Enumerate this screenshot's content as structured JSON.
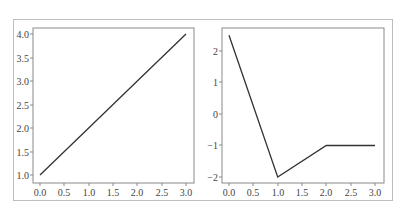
{
  "chart_data": [
    {
      "type": "line",
      "title": "",
      "xlabel": "",
      "ylabel": "",
      "x": [
        0,
        1,
        2,
        3
      ],
      "series": [
        {
          "name": "",
          "values": [
            1,
            2,
            3,
            4
          ],
          "color": "#333333"
        }
      ],
      "xlim": [
        -0.15,
        3.15
      ],
      "ylim": [
        0.85,
        4.15
      ],
      "xticks": [
        "0.0",
        "0.5",
        "1.0",
        "1.5",
        "2.0",
        "2.5",
        "3.0"
      ],
      "yticks": [
        "1.0",
        "1.5",
        "2.0",
        "2.5",
        "3.0",
        "3.5",
        "4.0"
      ],
      "grid": false,
      "legend": null
    },
    {
      "type": "line",
      "title": "",
      "xlabel": "",
      "ylabel": "",
      "x": [
        0,
        1,
        2,
        3
      ],
      "series": [
        {
          "name": "",
          "values": [
            2.5,
            -2,
            -1,
            -1
          ],
          "color": "#333333"
        }
      ],
      "xlim": [
        -0.15,
        3.15
      ],
      "ylim": [
        -2.2,
        2.7
      ],
      "xticks": [
        "0.0",
        "0.5",
        "1.0",
        "1.5",
        "2.0",
        "2.5",
        "3.0"
      ],
      "yticks": [
        "-2",
        "-1",
        "0",
        "1",
        "2"
      ],
      "grid": false,
      "legend": null
    }
  ],
  "ticks": {
    "left_x": [
      "0.0",
      "0.5",
      "1.0",
      "1.5",
      "2.0",
      "2.5",
      "3.0"
    ],
    "left_y": [
      "4.0",
      "3.5",
      "3.0",
      "2.5",
      "2.0",
      "1.5",
      "1.0"
    ],
    "right_x": [
      "0.0",
      "0.5",
      "1.0",
      "1.5",
      "2.0",
      "2.5",
      "3.0"
    ],
    "right_y": [
      "2",
      "1",
      "0",
      "−1",
      "−2"
    ]
  }
}
